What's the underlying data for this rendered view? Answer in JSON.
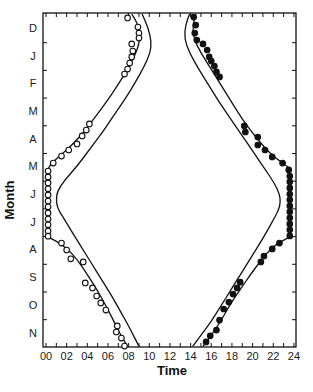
{
  "chart_data": {
    "type": "scatter",
    "title": "",
    "xlabel": "Time",
    "ylabel": "Month",
    "xlim": [
      0,
      24
    ],
    "x_tick_labels": [
      "00",
      "02",
      "04",
      "06",
      "08",
      "10",
      "12",
      "14",
      "16",
      "18",
      "20",
      "22",
      "24"
    ],
    "y_tick_labels": [
      "D",
      "J",
      "F",
      "M",
      "A",
      "M",
      "J",
      "J",
      "A",
      "S",
      "O",
      "N"
    ],
    "y_axis_note": "month index 0 = top (start of Dec) to 12 = bottom (end of Nov)",
    "grid": false,
    "legend": null,
    "series": [
      {
        "name": "observed morning (open circles)",
        "marker": "open-circle",
        "points": [
          [
            7.9,
            0.14
          ],
          [
            8.9,
            0.47
          ],
          [
            9.0,
            0.69
          ],
          [
            9.0,
            0.87
          ],
          [
            8.3,
            1.08
          ],
          [
            8.4,
            1.34
          ],
          [
            8.3,
            1.55
          ],
          [
            8.1,
            1.77
          ],
          [
            7.9,
            1.99
          ],
          [
            7.6,
            2.17
          ],
          [
            4.2,
            3.97
          ],
          [
            3.9,
            4.19
          ],
          [
            3.5,
            4.4
          ],
          [
            3.0,
            4.69
          ],
          [
            2.2,
            4.91
          ],
          [
            1.5,
            5.13
          ],
          [
            0.7,
            5.38
          ],
          [
            0.2,
            5.67
          ],
          [
            0.2,
            5.88
          ],
          [
            0.2,
            6.1
          ],
          [
            0.2,
            6.31
          ],
          [
            0.2,
            6.53
          ],
          [
            0.2,
            6.75
          ],
          [
            0.2,
            6.96
          ],
          [
            0.2,
            7.18
          ],
          [
            0.2,
            7.4
          ],
          [
            0.2,
            7.61
          ],
          [
            0.2,
            7.83
          ],
          [
            0.2,
            8.02
          ],
          [
            1.5,
            8.27
          ],
          [
            2.0,
            8.52
          ],
          [
            2.4,
            8.84
          ],
          [
            3.6,
            8.95
          ],
          [
            3.8,
            9.71
          ],
          [
            4.5,
            9.89
          ],
          [
            4.9,
            10.18
          ],
          [
            5.3,
            10.43
          ],
          [
            5.8,
            10.69
          ],
          [
            6.9,
            11.26
          ],
          [
            6.8,
            11.48
          ],
          [
            7.3,
            11.7
          ],
          [
            7.6,
            11.99
          ]
        ]
      },
      {
        "name": "observed evening (filled circles)",
        "marker": "filled-circle",
        "points": [
          [
            14.3,
            0.11
          ],
          [
            14.5,
            0.4
          ],
          [
            14.4,
            0.69
          ],
          [
            14.6,
            0.94
          ],
          [
            15.2,
            1.08
          ],
          [
            15.6,
            1.3
          ],
          [
            15.8,
            1.55
          ],
          [
            16.0,
            1.7
          ],
          [
            16.3,
            1.88
          ],
          [
            16.5,
            2.09
          ],
          [
            16.8,
            2.27
          ],
          [
            19.2,
            4.04
          ],
          [
            19.3,
            4.26
          ],
          [
            20.5,
            4.44
          ],
          [
            20.5,
            4.73
          ],
          [
            21.2,
            4.91
          ],
          [
            21.9,
            5.16
          ],
          [
            22.9,
            5.38
          ],
          [
            23.5,
            5.63
          ],
          [
            23.6,
            5.85
          ],
          [
            23.6,
            6.06
          ],
          [
            23.6,
            6.28
          ],
          [
            23.6,
            6.5
          ],
          [
            23.6,
            6.71
          ],
          [
            23.6,
            6.93
          ],
          [
            23.6,
            7.14
          ],
          [
            23.6,
            7.36
          ],
          [
            23.6,
            7.58
          ],
          [
            23.6,
            7.79
          ],
          [
            23.6,
            8.01
          ],
          [
            22.6,
            8.27
          ],
          [
            21.9,
            8.48
          ],
          [
            21.1,
            8.74
          ],
          [
            20.8,
            8.95
          ],
          [
            18.8,
            9.68
          ],
          [
            18.5,
            9.89
          ],
          [
            18.1,
            10.11
          ],
          [
            17.7,
            10.4
          ],
          [
            17.2,
            10.65
          ],
          [
            16.8,
            11.05
          ],
          [
            16.5,
            11.41
          ],
          [
            15.9,
            11.62
          ],
          [
            15.5,
            11.84
          ]
        ]
      },
      {
        "name": "fitted morning curve (inner)",
        "marker": "line",
        "points": [
          [
            8.3,
            0.0
          ],
          [
            8.8,
            0.3
          ],
          [
            9.1,
            0.7
          ],
          [
            9.0,
            1.1
          ],
          [
            8.6,
            1.5
          ],
          [
            7.9,
            2.0
          ],
          [
            6.9,
            2.6
          ],
          [
            5.8,
            3.2
          ],
          [
            4.8,
            3.7
          ],
          [
            3.8,
            4.2
          ],
          [
            2.6,
            4.7
          ],
          [
            1.4,
            5.1
          ],
          [
            0.5,
            5.4
          ],
          [
            0.2,
            5.6
          ]
        ]
      },
      {
        "name": "fitted morning curve (inner, autumn)",
        "marker": "line",
        "points": [
          [
            0.2,
            8.05
          ],
          [
            1.0,
            8.2
          ],
          [
            2.0,
            8.45
          ],
          [
            3.0,
            8.85
          ],
          [
            4.0,
            9.4
          ],
          [
            5.0,
            10.0
          ],
          [
            5.9,
            10.6
          ],
          [
            6.7,
            11.2
          ],
          [
            7.4,
            11.7
          ],
          [
            7.9,
            12.0
          ]
        ]
      },
      {
        "name": "civil twilight envelope morning (outer)",
        "marker": "line",
        "points": [
          [
            9.3,
            0.0
          ],
          [
            9.9,
            0.5
          ],
          [
            10.2,
            1.0
          ],
          [
            10.1,
            1.4
          ],
          [
            9.5,
            1.9
          ],
          [
            8.6,
            2.5
          ],
          [
            7.6,
            3.1
          ],
          [
            6.5,
            3.7
          ],
          [
            5.4,
            4.3
          ],
          [
            4.2,
            4.9
          ],
          [
            3.0,
            5.5
          ],
          [
            1.8,
            6.0
          ],
          [
            1.1,
            6.4
          ],
          [
            1.0,
            6.7
          ],
          [
            1.1,
            7.0
          ],
          [
            1.6,
            7.3
          ],
          [
            2.4,
            7.8
          ],
          [
            3.4,
            8.4
          ],
          [
            4.4,
            9.0
          ],
          [
            5.4,
            9.6
          ],
          [
            6.4,
            10.2
          ],
          [
            7.3,
            10.8
          ],
          [
            8.2,
            11.4
          ],
          [
            9.0,
            12.0
          ]
        ]
      },
      {
        "name": "fitted evening curve (inner)",
        "marker": "line",
        "points": [
          [
            14.5,
            0.0
          ],
          [
            14.2,
            0.4
          ],
          [
            14.3,
            0.9
          ],
          [
            15.0,
            1.4
          ],
          [
            16.0,
            2.0
          ],
          [
            17.0,
            2.6
          ],
          [
            18.0,
            3.2
          ],
          [
            19.0,
            3.8
          ],
          [
            20.0,
            4.3
          ],
          [
            21.1,
            4.8
          ],
          [
            22.2,
            5.2
          ],
          [
            23.2,
            5.45
          ],
          [
            23.6,
            5.6
          ]
        ]
      },
      {
        "name": "fitted evening curve (inner, autumn)",
        "marker": "line",
        "points": [
          [
            23.6,
            8.05
          ],
          [
            22.8,
            8.2
          ],
          [
            21.8,
            8.45
          ],
          [
            20.8,
            8.9
          ],
          [
            19.8,
            9.4
          ],
          [
            18.8,
            9.95
          ],
          [
            17.8,
            10.5
          ],
          [
            16.9,
            11.1
          ],
          [
            16.0,
            11.6
          ],
          [
            15.2,
            12.0
          ]
        ]
      },
      {
        "name": "civil twilight envelope evening (outer)",
        "marker": "line",
        "points": [
          [
            13.9,
            0.0
          ],
          [
            13.5,
            0.4
          ],
          [
            13.4,
            0.9
          ],
          [
            13.9,
            1.4
          ],
          [
            14.8,
            2.0
          ],
          [
            15.8,
            2.6
          ],
          [
            16.8,
            3.2
          ],
          [
            17.9,
            3.8
          ],
          [
            19.0,
            4.4
          ],
          [
            20.1,
            5.0
          ],
          [
            21.2,
            5.6
          ],
          [
            22.1,
            6.1
          ],
          [
            22.6,
            6.5
          ],
          [
            22.7,
            6.8
          ],
          [
            22.5,
            7.1
          ],
          [
            21.9,
            7.5
          ],
          [
            21.0,
            8.1
          ],
          [
            20.0,
            8.7
          ],
          [
            19.0,
            9.3
          ],
          [
            18.0,
            9.9
          ],
          [
            17.0,
            10.5
          ],
          [
            16.0,
            11.1
          ],
          [
            15.0,
            11.6
          ],
          [
            14.2,
            12.0
          ]
        ]
      }
    ]
  },
  "axes": {
    "x_title": "Time",
    "y_title": "Month"
  }
}
